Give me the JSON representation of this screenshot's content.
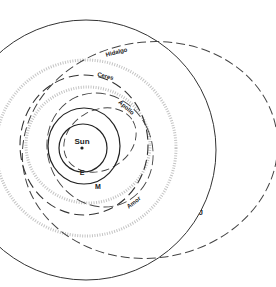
{
  "diagram": {
    "labels": {
      "sun": "Sun",
      "earth": "E",
      "mars": "M",
      "jupiter": "J",
      "ceres": "Ceres",
      "hidalgo": "Hidalgo",
      "apollo": "Apollo",
      "amor": "Amor"
    },
    "colors": {
      "line": "#333333",
      "stipple": "#bdbdbd",
      "background": "#ffffff"
    }
  }
}
